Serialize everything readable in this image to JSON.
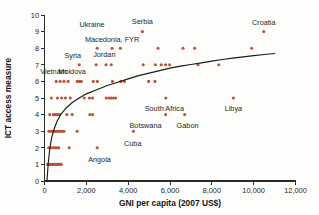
{
  "chart_data": {
    "type": "scatter",
    "title": "",
    "xlabel": "GNI per capita (2007  US$)",
    "ylabel": "ICT access measure",
    "xlim": [
      0,
      12000
    ],
    "ylim": [
      0,
      10
    ],
    "xticks": [
      0,
      2000,
      4000,
      6000,
      8000,
      10000,
      12000
    ],
    "xticklabels": [
      "0",
      "2,000",
      "4,000",
      "6,000",
      "8,000",
      "10,000",
      "12,000"
    ],
    "yticks": [
      0,
      1,
      2,
      3,
      4,
      5,
      6,
      7,
      8,
      9,
      10
    ],
    "yticklabels": [
      "0",
      "1",
      "2",
      "3",
      "4",
      "5",
      "6",
      "7",
      "8",
      "9",
      "10"
    ],
    "grid": false,
    "legend": false,
    "point_color": "#b8543a",
    "curve_color": "#1b1b1b",
    "series": [
      {
        "name": "Countries",
        "points": [
          [
            150,
            1
          ],
          [
            230,
            1
          ],
          [
            300,
            1
          ],
          [
            360,
            1
          ],
          [
            420,
            1
          ],
          [
            480,
            1
          ],
          [
            540,
            1
          ],
          [
            600,
            1
          ],
          [
            660,
            1
          ],
          [
            720,
            1
          ],
          [
            800,
            1
          ],
          [
            200,
            2
          ],
          [
            330,
            2
          ],
          [
            420,
            2
          ],
          [
            510,
            2
          ],
          [
            600,
            2
          ],
          [
            680,
            2
          ],
          [
            1180,
            2
          ],
          [
            2520,
            2
          ],
          [
            210,
            3
          ],
          [
            300,
            3
          ],
          [
            380,
            3
          ],
          [
            450,
            3
          ],
          [
            520,
            3
          ],
          [
            590,
            3
          ],
          [
            650,
            3
          ],
          [
            720,
            3
          ],
          [
            790,
            3
          ],
          [
            860,
            3
          ],
          [
            930,
            3
          ],
          [
            1560,
            3
          ],
          [
            4250,
            3
          ],
          [
            250,
            4
          ],
          [
            420,
            4
          ],
          [
            500,
            4
          ],
          [
            560,
            4
          ],
          [
            640,
            4
          ],
          [
            720,
            4
          ],
          [
            1070,
            4
          ],
          [
            1320,
            4
          ],
          [
            2170,
            4
          ],
          [
            2300,
            4
          ],
          [
            5790,
            4
          ],
          [
            6700,
            4
          ],
          [
            330,
            5
          ],
          [
            620,
            5
          ],
          [
            820,
            5
          ],
          [
            1000,
            5
          ],
          [
            1230,
            5
          ],
          [
            1900,
            5
          ],
          [
            2150,
            5
          ],
          [
            2300,
            5
          ],
          [
            2950,
            5
          ],
          [
            3080,
            5
          ],
          [
            3190,
            5
          ],
          [
            3300,
            5
          ],
          [
            3400,
            5
          ],
          [
            5800,
            5
          ],
          [
            9030,
            5
          ],
          [
            560,
            6
          ],
          [
            750,
            6
          ],
          [
            930,
            6
          ],
          [
            1130,
            6
          ],
          [
            1560,
            6
          ],
          [
            1660,
            6
          ],
          [
            1760,
            6
          ],
          [
            2330,
            6
          ],
          [
            2530,
            6
          ],
          [
            3250,
            6
          ],
          [
            3650,
            6
          ],
          [
            3820,
            6
          ],
          [
            4980,
            6
          ],
          [
            5280,
            6
          ],
          [
            1660,
            7
          ],
          [
            2470,
            7
          ],
          [
            2940,
            7
          ],
          [
            3190,
            7
          ],
          [
            4720,
            7
          ],
          [
            5300,
            7
          ],
          [
            5580,
            7
          ],
          [
            5790,
            7
          ],
          [
            5980,
            7
          ],
          [
            7340,
            7
          ],
          [
            8330,
            7
          ],
          [
            2520,
            8
          ],
          [
            3230,
            8
          ],
          [
            3630,
            8
          ],
          [
            5430,
            8
          ],
          [
            6620,
            8
          ],
          [
            7180,
            8
          ],
          [
            9900,
            8
          ],
          [
            4680,
            9
          ],
          [
            10480,
            9
          ]
        ]
      }
    ],
    "trend_curve": {
      "description": "logarithmic fit through the scatter",
      "points": [
        [
          120,
          0.05
        ],
        [
          180,
          1.1
        ],
        [
          250,
          1.9
        ],
        [
          340,
          2.6
        ],
        [
          450,
          3.1
        ],
        [
          600,
          3.6
        ],
        [
          800,
          4.05
        ],
        [
          1000,
          4.35
        ],
        [
          1300,
          4.7
        ],
        [
          1600,
          4.95
        ],
        [
          2000,
          5.25
        ],
        [
          2500,
          5.5
        ],
        [
          3000,
          5.75
        ],
        [
          3500,
          5.95
        ],
        [
          4000,
          6.15
        ],
        [
          4500,
          6.35
        ],
        [
          5000,
          6.5
        ],
        [
          5500,
          6.65
        ],
        [
          6000,
          6.8
        ],
        [
          6500,
          6.92
        ],
        [
          7000,
          7.02
        ],
        [
          7500,
          7.12
        ],
        [
          8000,
          7.22
        ],
        [
          8500,
          7.32
        ],
        [
          9000,
          7.4
        ],
        [
          9500,
          7.48
        ],
        [
          10000,
          7.55
        ],
        [
          10500,
          7.62
        ],
        [
          11000,
          7.68
        ]
      ]
    },
    "annotations": [
      {
        "label": "Croatia",
        "x": 10480,
        "y": 9,
        "dx": 0,
        "dy": 0.55,
        "anchor": "middle"
      },
      {
        "label": "Serbia",
        "x": 4680,
        "y": 9,
        "dx": 0,
        "dy": 0.62,
        "anchor": "middle"
      },
      {
        "label": "Macedonia, FYR",
        "x": 3230,
        "y": 8,
        "dx": 0,
        "dy": 0.55,
        "anchor": "middle"
      },
      {
        "label": "Ukraine",
        "x": 2520,
        "y": 8,
        "dx": -250,
        "dy": 1.42,
        "anchor": "middle"
      },
      {
        "label": "Jordan",
        "x": 2940,
        "y": 7,
        "dx": -80,
        "dy": 0.6,
        "anchor": "middle"
      },
      {
        "label": "Syria",
        "x": 1660,
        "y": 7,
        "dx": -310,
        "dy": 0.56,
        "anchor": "middle"
      },
      {
        "label": "Moldova",
        "x": 1130,
        "y": 6,
        "dx": 190,
        "dy": 0.58,
        "anchor": "middle"
      },
      {
        "label": "Vietnam",
        "x": 560,
        "y": 6,
        "dx": -130,
        "dy": 0.58,
        "anchor": "middle"
      },
      {
        "label": "South Africa",
        "x": 5800,
        "y": 5,
        "dx": -70,
        "dy": -0.62,
        "anchor": "middle"
      },
      {
        "label": "Libya",
        "x": 9030,
        "y": 5,
        "dx": 0,
        "dy": -0.62,
        "anchor": "middle"
      },
      {
        "label": "Botswana",
        "x": 5790,
        "y": 4,
        "dx": -960,
        "dy": -0.68,
        "anchor": "middle"
      },
      {
        "label": "Gabon",
        "x": 6700,
        "y": 4,
        "dx": 140,
        "dy": -0.68,
        "anchor": "middle"
      },
      {
        "label": "Cuba",
        "x": 4250,
        "y": 3,
        "dx": -30,
        "dy": -0.72,
        "anchor": "middle"
      },
      {
        "label": "Angola",
        "x": 2520,
        "y": 2,
        "dx": 110,
        "dy": -0.68,
        "anchor": "middle"
      }
    ]
  }
}
